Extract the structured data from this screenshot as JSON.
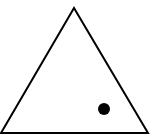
{
  "diagram": {
    "background": "#ffffff",
    "stroke_color": "#000000",
    "stroke_width": 2,
    "triangle": {
      "type": "equilateral-outline",
      "points": "74,8 1,133 148,133"
    },
    "dot": {
      "cx": 104,
      "cy": 109,
      "r": 6,
      "fill": "#000000"
    }
  }
}
